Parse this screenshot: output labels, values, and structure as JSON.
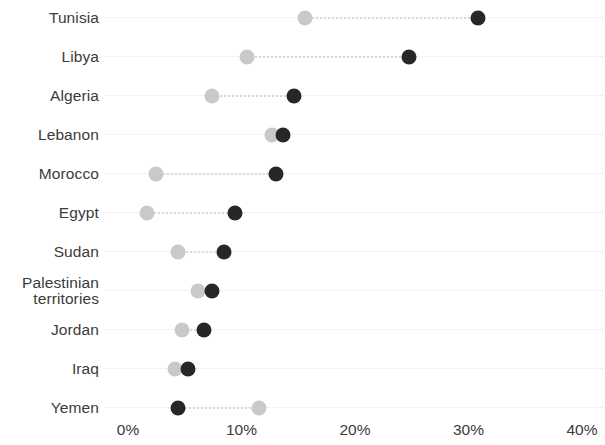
{
  "chart_data": {
    "type": "scatter",
    "subtype": "dot-plot",
    "title": "",
    "subtitle": "",
    "xlabel": "",
    "ylabel": "",
    "xlim": [
      0,
      40
    ],
    "x_ticks": [
      0,
      10,
      20,
      30,
      40
    ],
    "x_tick_labels": [
      "0%",
      "10%",
      "20%",
      "30%",
      "40%"
    ],
    "grid": false,
    "connectors": true,
    "legend": "none",
    "categories": [
      "Tunisia",
      "Libya",
      "Algeria",
      "Lebanon",
      "Morocco",
      "Egypt",
      "Sudan",
      "Palestinian\nterritories",
      "Jordan",
      "Iraq",
      "Yemen"
    ],
    "series": [
      {
        "name": "light",
        "color": "#c9c9c9",
        "values": [
          15.6,
          10.5,
          7.4,
          12.7,
          2.5,
          1.7,
          4.4,
          6.2,
          4.8,
          4.1,
          11.5
        ]
      },
      {
        "name": "dark",
        "color": "#272727",
        "values": [
          30.8,
          24.8,
          14.6,
          13.7,
          13.0,
          9.4,
          8.5,
          7.4,
          6.7,
          5.3,
          4.4
        ]
      }
    ]
  },
  "axis": {
    "x_pixel_zero": 128,
    "x_pixel_per_percent": 11.35
  },
  "colors": {
    "light_marker": "#c9c9c9",
    "dark_marker": "#272727",
    "connector": "#d9d9d9",
    "text": "#3b3b3b",
    "background": "#ffffff"
  }
}
